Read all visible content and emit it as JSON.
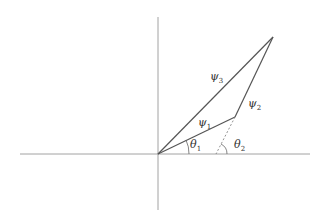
{
  "diagram": {
    "vectors": [
      {
        "id": "psi1",
        "label": "ψ",
        "subscript": "1"
      },
      {
        "id": "psi2",
        "label": "ψ",
        "subscript": "2"
      },
      {
        "id": "psi3",
        "label": "ψ",
        "subscript": "3"
      }
    ],
    "angles": [
      {
        "id": "theta1",
        "label": "θ",
        "subscript": "1"
      },
      {
        "id": "theta2",
        "label": "θ",
        "subscript": "2"
      }
    ],
    "colors": {
      "axis": "#8a8a8a",
      "vector": "#555555",
      "text": "#333333"
    }
  }
}
